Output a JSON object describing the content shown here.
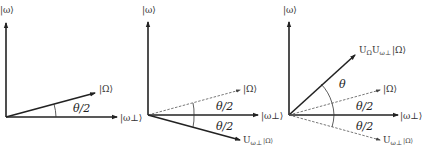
{
  "figure": {
    "panels": [
      {
        "id": "panel-1",
        "labels": {
          "y_axis": "|ω⟩",
          "x_axis": "|ω⊥⟩",
          "state": "|Ω⟩",
          "angle": "θ/2"
        }
      },
      {
        "id": "panel-2",
        "labels": {
          "y_axis": "|ω⟩",
          "x_axis": "|ω⊥⟩",
          "state": "|Ω⟩",
          "angle_upper": "θ/2",
          "angle_lower": "θ/2",
          "reflected_state": "U",
          "reflected_state_sub": "ω⊥",
          "reflected_state_ket": "|Ω⟩"
        }
      },
      {
        "id": "panel-3",
        "labels": {
          "y_axis": "|ω⟩",
          "x_axis": "|ω⊥⟩",
          "state": "|Ω⟩",
          "angle_theta": "θ",
          "angle_upper": "θ/2",
          "angle_lower": "θ/2",
          "rotated_state_u1": "U",
          "rotated_state_sub1": "Ω",
          "rotated_state_u2": "U",
          "rotated_state_sub2": "ω⊥",
          "rotated_state_ket": "|Ω⟩",
          "reflected_state": "U",
          "reflected_state_sub": "ω⊥",
          "reflected_state_ket": "|Ω⟩"
        }
      }
    ],
    "colors": {
      "line": "#222222",
      "dashed": "#555555",
      "background": "#ffffff"
    }
  }
}
